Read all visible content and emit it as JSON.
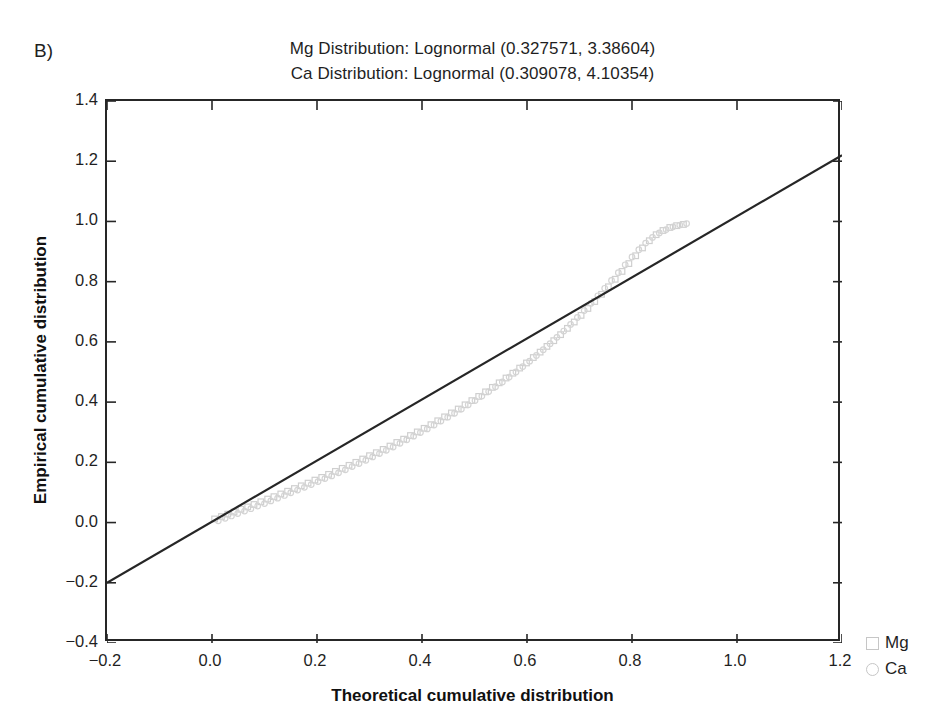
{
  "panel": {
    "label": "B)"
  },
  "legend": {
    "position": "right-bottom-outside",
    "entries": [
      {
        "label": "Mg",
        "marker": "square",
        "color": "#c6c6c6"
      },
      {
        "label": "Ca",
        "marker": "circle",
        "color": "#c6c6c6"
      }
    ]
  },
  "chart_data": {
    "type": "scatter",
    "title": "Mg Distribution: Lognormal (0.327571, 3.38604)",
    "title_lines": [
      "Mg Distribution: Lognormal (0.327571, 3.38604)",
      "Ca Distribution: Lognormal (0.309078, 4.10354)"
    ],
    "subtitle": "Ca Distribution: Lognormal (0.309078, 4.10354)",
    "xlabel": "Theoretical cumulative distribution",
    "ylabel": "Empirical cumulative distribution",
    "xlim": [
      -0.2,
      1.2
    ],
    "ylim": [
      -0.4,
      1.4
    ],
    "xticks": [
      -0.2,
      0.0,
      0.2,
      0.4,
      0.6,
      0.8,
      1.0,
      1.2
    ],
    "yticks": [
      -0.4,
      -0.2,
      0.0,
      0.2,
      0.4,
      0.6,
      0.8,
      1.0,
      1.2,
      1.4
    ],
    "xtick_labels": [
      "−0.2",
      "0.0",
      "0.2",
      "0.4",
      "0.6",
      "0.8",
      "1.0",
      "1.2"
    ],
    "ytick_labels": [
      "−0.4",
      "−0.2",
      "0.0",
      "0.2",
      "0.4",
      "0.6",
      "0.8",
      "1.0",
      "1.2",
      "1.4"
    ],
    "grid": false,
    "reference_line": {
      "name": "identity-line",
      "type": "line",
      "x": [
        -0.2,
        1.2
      ],
      "y": [
        -0.2,
        1.22
      ],
      "color": "#262626",
      "width": 2.2
    },
    "series": [
      {
        "name": "Mg",
        "marker": "square",
        "color": "#cfcfcf",
        "points": [
          [
            0.005,
            0.012
          ],
          [
            0.018,
            0.02
          ],
          [
            0.03,
            0.028
          ],
          [
            0.042,
            0.035
          ],
          [
            0.055,
            0.044
          ],
          [
            0.068,
            0.052
          ],
          [
            0.08,
            0.06
          ],
          [
            0.093,
            0.069
          ],
          [
            0.106,
            0.078
          ],
          [
            0.118,
            0.086
          ],
          [
            0.131,
            0.095
          ],
          [
            0.144,
            0.104
          ],
          [
            0.157,
            0.113
          ],
          [
            0.17,
            0.122
          ],
          [
            0.183,
            0.131
          ],
          [
            0.196,
            0.141
          ],
          [
            0.209,
            0.15
          ],
          [
            0.222,
            0.16
          ],
          [
            0.235,
            0.17
          ],
          [
            0.248,
            0.18
          ],
          [
            0.261,
            0.19
          ],
          [
            0.274,
            0.2
          ],
          [
            0.287,
            0.211
          ],
          [
            0.3,
            0.222
          ],
          [
            0.313,
            0.232
          ],
          [
            0.326,
            0.243
          ],
          [
            0.339,
            0.254
          ],
          [
            0.352,
            0.266
          ],
          [
            0.365,
            0.277
          ],
          [
            0.378,
            0.289
          ],
          [
            0.391,
            0.301
          ],
          [
            0.404,
            0.313
          ],
          [
            0.417,
            0.325
          ],
          [
            0.43,
            0.338
          ],
          [
            0.443,
            0.351
          ],
          [
            0.456,
            0.364
          ],
          [
            0.469,
            0.377
          ],
          [
            0.482,
            0.391
          ],
          [
            0.495,
            0.405
          ],
          [
            0.508,
            0.419
          ],
          [
            0.521,
            0.434
          ],
          [
            0.534,
            0.449
          ],
          [
            0.547,
            0.464
          ],
          [
            0.56,
            0.48
          ],
          [
            0.573,
            0.496
          ],
          [
            0.586,
            0.513
          ],
          [
            0.599,
            0.53
          ],
          [
            0.612,
            0.548
          ],
          [
            0.625,
            0.566
          ],
          [
            0.638,
            0.585
          ],
          [
            0.651,
            0.604
          ],
          [
            0.664,
            0.624
          ],
          [
            0.677,
            0.645
          ],
          [
            0.69,
            0.666
          ],
          [
            0.703,
            0.688
          ],
          [
            0.716,
            0.711
          ],
          [
            0.729,
            0.734
          ],
          [
            0.742,
            0.758
          ],
          [
            0.755,
            0.783
          ],
          [
            0.768,
            0.808
          ],
          [
            0.781,
            0.834
          ],
          [
            0.794,
            0.86
          ],
          [
            0.807,
            0.886
          ],
          [
            0.82,
            0.912
          ],
          [
            0.833,
            0.936
          ],
          [
            0.846,
            0.956
          ],
          [
            0.859,
            0.97
          ],
          [
            0.872,
            0.98
          ],
          [
            0.885,
            0.986
          ],
          [
            0.898,
            0.99
          ]
        ]
      },
      {
        "name": "Ca",
        "marker": "circle",
        "color": "#d4d4d4",
        "points": [
          [
            0.012,
            0.006
          ],
          [
            0.025,
            0.014
          ],
          [
            0.037,
            0.022
          ],
          [
            0.049,
            0.03
          ],
          [
            0.062,
            0.038
          ],
          [
            0.074,
            0.046
          ],
          [
            0.087,
            0.055
          ],
          [
            0.1,
            0.063
          ],
          [
            0.112,
            0.072
          ],
          [
            0.125,
            0.081
          ],
          [
            0.138,
            0.09
          ],
          [
            0.15,
            0.099
          ],
          [
            0.163,
            0.108
          ],
          [
            0.176,
            0.117
          ],
          [
            0.189,
            0.126
          ],
          [
            0.202,
            0.136
          ],
          [
            0.215,
            0.146
          ],
          [
            0.228,
            0.155
          ],
          [
            0.241,
            0.165
          ],
          [
            0.254,
            0.175
          ],
          [
            0.267,
            0.186
          ],
          [
            0.28,
            0.196
          ],
          [
            0.293,
            0.207
          ],
          [
            0.306,
            0.218
          ],
          [
            0.319,
            0.229
          ],
          [
            0.332,
            0.24
          ],
          [
            0.345,
            0.251
          ],
          [
            0.358,
            0.263
          ],
          [
            0.371,
            0.275
          ],
          [
            0.384,
            0.287
          ],
          [
            0.397,
            0.299
          ],
          [
            0.41,
            0.311
          ],
          [
            0.423,
            0.324
          ],
          [
            0.436,
            0.337
          ],
          [
            0.449,
            0.35
          ],
          [
            0.462,
            0.363
          ],
          [
            0.475,
            0.377
          ],
          [
            0.488,
            0.391
          ],
          [
            0.501,
            0.405
          ],
          [
            0.514,
            0.42
          ],
          [
            0.527,
            0.435
          ],
          [
            0.54,
            0.451
          ],
          [
            0.553,
            0.467
          ],
          [
            0.566,
            0.483
          ],
          [
            0.579,
            0.5
          ],
          [
            0.592,
            0.518
          ],
          [
            0.605,
            0.536
          ],
          [
            0.618,
            0.555
          ],
          [
            0.631,
            0.574
          ],
          [
            0.644,
            0.594
          ],
          [
            0.657,
            0.615
          ],
          [
            0.67,
            0.636
          ],
          [
            0.683,
            0.658
          ],
          [
            0.696,
            0.681
          ],
          [
            0.709,
            0.704
          ],
          [
            0.722,
            0.728
          ],
          [
            0.735,
            0.753
          ],
          [
            0.748,
            0.778
          ],
          [
            0.761,
            0.804
          ],
          [
            0.774,
            0.83
          ],
          [
            0.787,
            0.856
          ],
          [
            0.8,
            0.882
          ],
          [
            0.813,
            0.906
          ],
          [
            0.826,
            0.928
          ],
          [
            0.839,
            0.947
          ],
          [
            0.852,
            0.962
          ],
          [
            0.865,
            0.973
          ],
          [
            0.878,
            0.982
          ],
          [
            0.891,
            0.988
          ],
          [
            0.904,
            0.993
          ]
        ]
      }
    ]
  }
}
